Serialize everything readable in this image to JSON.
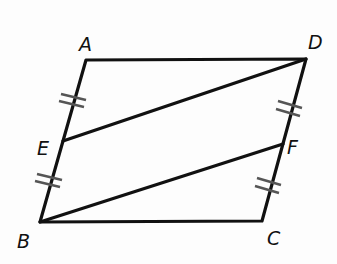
{
  "diagram": {
    "type": "geometry-figure",
    "colors": {
      "stroke": "#111111",
      "tick": "#555555",
      "background": "#fdfdfd"
    },
    "points": {
      "A": {
        "label": "A",
        "x": 86,
        "y": 60
      },
      "D": {
        "label": "D",
        "x": 306,
        "y": 59
      },
      "E": {
        "label": "E",
        "x": 63,
        "y": 141
      },
      "F": {
        "label": "F",
        "x": 283,
        "y": 144
      },
      "B": {
        "label": "B",
        "x": 40,
        "y": 222
      },
      "C": {
        "label": "C",
        "x": 262,
        "y": 221
      }
    },
    "segments": [
      "AD",
      "AB",
      "BC",
      "CD",
      "DE",
      "BF"
    ],
    "congruence_marks": [
      {
        "segment": "AE",
        "ticks": 2
      },
      {
        "segment": "EB",
        "ticks": 2
      },
      {
        "segment": "DF",
        "ticks": 2
      },
      {
        "segment": "FC",
        "ticks": 2
      }
    ]
  }
}
